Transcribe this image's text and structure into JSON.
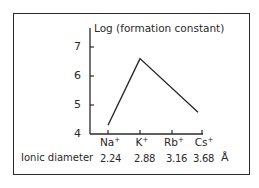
{
  "chart_data": {
    "type": "line",
    "title": "",
    "ylabel": "Log (formation constant)",
    "xlabel": "",
    "categories": [
      "Na+",
      "K+",
      "Rb+",
      "Cs+"
    ],
    "category_display": [
      {
        "base": "Na",
        "sup": "+"
      },
      {
        "base": "K",
        "sup": "+"
      },
      {
        "base": "Rb",
        "sup": "+"
      },
      {
        "base": "Cs",
        "sup": "+"
      }
    ],
    "series": [
      {
        "name": "Log (formation constant)",
        "points": [
          {
            "x": "Na+",
            "y": 4.3
          },
          {
            "x": "K+",
            "y": 6.6
          },
          {
            "x": "Rb+",
            "y": 5.7
          },
          {
            "x": "Cs+",
            "y": 4.75
          }
        ]
      }
    ],
    "ylim": [
      4,
      7.5
    ],
    "yticks": [
      4,
      5,
      6,
      7
    ],
    "grid": false,
    "legend": "none",
    "annotations": {
      "row_label": "Ionic diameter",
      "row_values": [
        "2.24",
        "2.88",
        "3.16",
        "3.68"
      ],
      "row_unit": "Å"
    }
  },
  "axis": {
    "y_label": "Log (formation constant)",
    "y_ticks": [
      "7",
      "6",
      "5",
      "4"
    ]
  },
  "diameter_row": {
    "label": "Ionic diameter",
    "values": [
      "2.24",
      "2.88",
      "3.16",
      "3.68"
    ],
    "unit": "Å"
  }
}
